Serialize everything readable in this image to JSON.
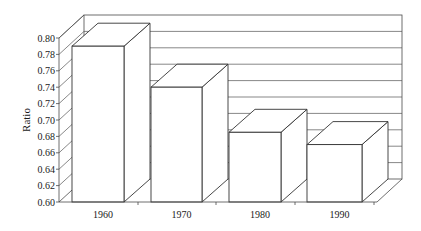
{
  "chart_data": {
    "type": "bar",
    "style": "3d-column",
    "title": "",
    "xlabel": "",
    "ylabel": "Ratio",
    "categories": [
      "1960",
      "1970",
      "1980",
      "1990"
    ],
    "values": [
      0.79,
      0.74,
      0.685,
      0.67
    ],
    "ylim": [
      0.6,
      0.8
    ],
    "yticks": [
      "0.60",
      "0.62",
      "0.64",
      "0.66",
      "0.68",
      "0.70",
      "0.72",
      "0.74",
      "0.76",
      "0.78",
      "0.80"
    ],
    "grid": true,
    "legend": null
  },
  "colors": {
    "bar_fill": "#ffffff",
    "bar_stroke": "#333333",
    "grid": "#555555",
    "text": "#1a1a1a"
  }
}
